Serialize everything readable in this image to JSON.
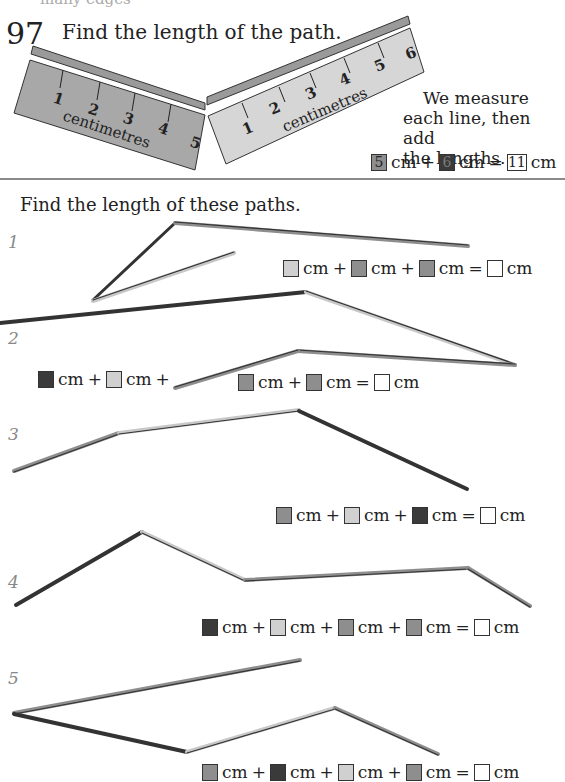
{
  "header": {
    "page_number": "97",
    "title": "Find the length of the path.",
    "top_cutoff_text": "many edges"
  },
  "example": {
    "ruler_left": {
      "label": "centimetres",
      "ticks": [
        "1",
        "2",
        "3",
        "4",
        "5"
      ],
      "color": "#a8a8a8"
    },
    "ruler_right": {
      "label": "centimetres",
      "ticks": [
        "1",
        "2",
        "3",
        "4",
        "5",
        "6"
      ],
      "color": "#d6d6d6"
    },
    "explanation": [
      "We measure",
      "each line, then add",
      "the lengths."
    ],
    "equation": {
      "a": "5",
      "b": "6",
      "result": "11",
      "unit": "cm",
      "plus": "+",
      "equals": "="
    }
  },
  "section": {
    "subtitle": "Find the length of these paths."
  },
  "questions": [
    {
      "number": "1",
      "swatches": [
        "light",
        "mid",
        "mid"
      ],
      "unit": "cm",
      "plus": "+",
      "equals": "="
    },
    {
      "number": "2",
      "swatches": [
        "dark",
        "light",
        "mid",
        "mid"
      ],
      "unit": "cm",
      "plus": "+",
      "equals": "="
    },
    {
      "number": "3",
      "swatches": [
        "mid",
        "light",
        "dark"
      ],
      "unit": "cm",
      "plus": "+",
      "equals": "="
    },
    {
      "number": "4",
      "swatches": [
        "dark",
        "light",
        "mid",
        "mid"
      ],
      "unit": "cm",
      "plus": "+",
      "equals": "="
    },
    {
      "number": "5",
      "swatches": [
        "mid",
        "dark",
        "light",
        "mid"
      ],
      "unit": "cm",
      "plus": "+",
      "equals": "="
    }
  ],
  "colors": {
    "light": "#d0d0d0",
    "mid": "#8e8e8e",
    "dark": "#3a3a3a",
    "rule": "#8a8a8a"
  }
}
